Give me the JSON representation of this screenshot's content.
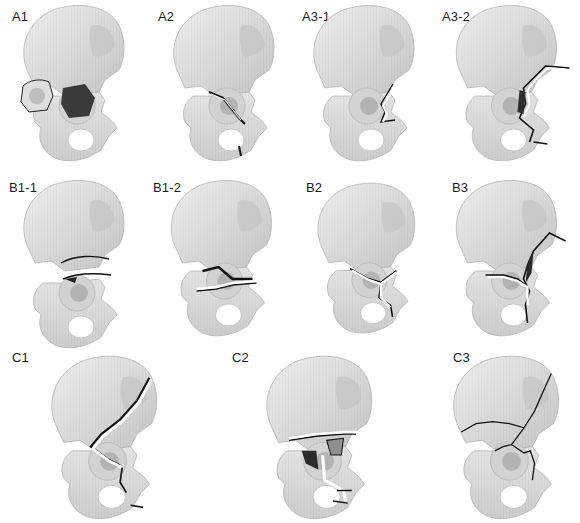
{
  "figure": {
    "colors": {
      "bone_light": "#e8e8e8",
      "bone_mid": "#cfcfcf",
      "bone_shadow": "#a9a9a9",
      "acetabulum": "#bdbdbd",
      "fracture_line": "#111111",
      "defect": "#3a3a3a",
      "background": "#ffffff"
    },
    "rows": [
      {
        "row": "A",
        "panels": [
          {
            "label": "A1",
            "feature": "posterior wall fragment displaced with dark defect"
          },
          {
            "label": "A2",
            "feature": "posterior column fracture"
          },
          {
            "label": "A3-1",
            "feature": "anterior wall fracture"
          },
          {
            "label": "A3-2",
            "feature": "anterior column fracture"
          }
        ]
      },
      {
        "row": "B",
        "panels": [
          {
            "label": "B1-1",
            "feature": "transverse fracture, infratectal (separated)"
          },
          {
            "label": "B1-2",
            "feature": "transverse fracture, transtectal"
          },
          {
            "label": "B2",
            "feature": "T-shaped fracture"
          },
          {
            "label": "B3",
            "feature": "anterior column with posterior hemitransverse"
          }
        ]
      },
      {
        "row": "C",
        "panels": [
          {
            "label": "C1",
            "feature": "both-column fracture, high"
          },
          {
            "label": "C2",
            "feature": "both-column fracture, low / comminuted"
          },
          {
            "label": "C3",
            "feature": "both-column fracture extending into sacroiliac joint"
          }
        ]
      }
    ]
  }
}
